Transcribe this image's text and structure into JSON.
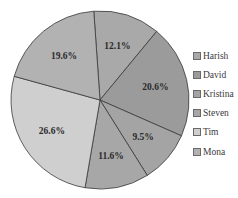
{
  "chart_data": {
    "type": "pie",
    "title": "",
    "categories": [
      "Harish",
      "David",
      "Kristina",
      "Steven",
      "Tim",
      "Mona"
    ],
    "values": [
      12.1,
      20.6,
      9.5,
      11.6,
      26.6,
      19.6
    ],
    "labels": [
      "12.1%",
      "20.6%",
      "9.5%",
      "11.6%",
      "26.6%",
      "19.6%"
    ],
    "colors": [
      "#a9a9a9",
      "#9b9b9b",
      "#a4a4a4",
      "#a7a7a7",
      "#cfcfcf",
      "#b2b2b2"
    ],
    "start_angle_deg": -4,
    "direction": "clockwise",
    "legend_position": "right"
  },
  "legend": {
    "items": [
      {
        "label": "Harish",
        "color": "#a9a9a9"
      },
      {
        "label": "David",
        "color": "#9b9b9b"
      },
      {
        "label": "Kristina",
        "color": "#a4a4a4"
      },
      {
        "label": "Steven",
        "color": "#a7a7a7"
      },
      {
        "label": "Tim",
        "color": "#cfcfcf"
      },
      {
        "label": "Mona",
        "color": "#b2b2b2"
      }
    ]
  }
}
